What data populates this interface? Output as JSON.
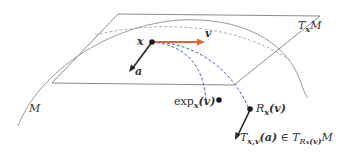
{
  "diagram": {
    "labels": {
      "manifold": "M",
      "tangent_space": {
        "base": "T",
        "sub": "x",
        "tail": "M"
      },
      "point_x": "x",
      "vector_v": "v",
      "vector_a": "a",
      "exp_map": {
        "fn": "exp",
        "sub": "x",
        "arg": "(v)"
      },
      "retraction": {
        "fn": "R",
        "sub": "x",
        "arg": "(v)"
      },
      "transport": {
        "fn": "T",
        "sub": "x,v",
        "arg": "(a)",
        "rel": "∈",
        "space": "T",
        "space_sub": "R",
        "space_subsub": "x",
        "space_subarg": "(v)",
        "tail": "M"
      }
    },
    "colors": {
      "manifold_curve": "#9a9a9a",
      "plane_edge": "#8a8a8a",
      "dashed_geodesic_gray": "#9a9a9a",
      "vector_v": "#e8603c",
      "dashed_blue": "#4a5fc8",
      "point": "#1a1a1a",
      "vector_a": "#222222",
      "text": "#333333"
    }
  }
}
